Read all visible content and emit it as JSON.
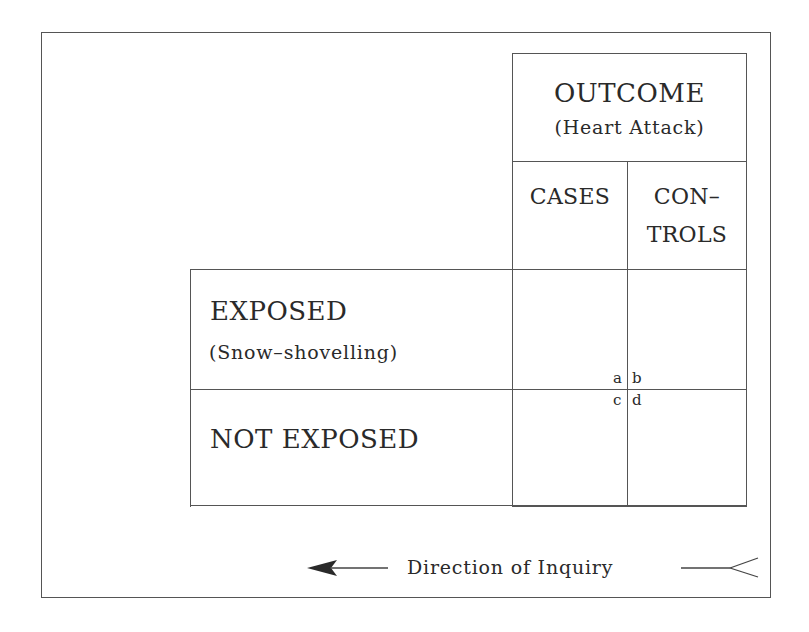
{
  "diagram": {
    "type": "case-control study 2x2 table",
    "outcome_header": {
      "title": "OUTCOME",
      "subtitle": "(Heart Attack)"
    },
    "columns": [
      {
        "label_line1": "CASES",
        "label_line2": ""
      },
      {
        "label_line1": "CON–",
        "label_line2": "TROLS"
      }
    ],
    "rows": [
      {
        "label": "EXPOSED",
        "sublabel": "(Snow–shovelling)"
      },
      {
        "label": "NOT EXPOSED",
        "sublabel": ""
      }
    ],
    "cells": {
      "a": "a",
      "b": "b",
      "c": "c",
      "d": "d"
    },
    "direction": {
      "label": "Direction of Inquiry",
      "arrow_direction": "left"
    },
    "colors": {
      "line": "#555555",
      "text": "#2a2a2a",
      "background": "#ffffff"
    }
  }
}
